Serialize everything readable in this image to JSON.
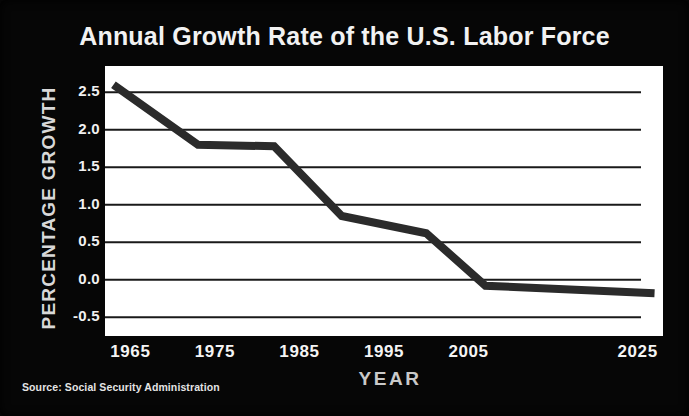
{
  "chart_data": {
    "type": "line",
    "title": "Annual Growth Rate of the U.S. Labor Force",
    "xlabel": "YEAR",
    "ylabel": "PERCENTAGE GROWTH",
    "source": "Source: Social Security Administration",
    "grid": true,
    "legend": false,
    "xlim": [
      1962,
      2028
    ],
    "ylim": [
      -0.75,
      2.85
    ],
    "xticks": [
      "1965",
      "1975",
      "1985",
      "1995",
      "2005",
      "2025"
    ],
    "xtick_values": [
      1965,
      1975,
      1985,
      1995,
      2005,
      2025
    ],
    "yticks": [
      "2.5",
      "2.0",
      "1.5",
      "1.0",
      "0.5",
      "0.0",
      "-0.5"
    ],
    "ytick_values": [
      2.5,
      2.0,
      1.5,
      1.0,
      0.5,
      0.0,
      -0.5
    ],
    "series": [
      {
        "name": "Annual growth rate of the U.S. labor force",
        "color": "#2b2b2b",
        "x": [
          1963,
          1973,
          1982,
          1990,
          2000,
          2007,
          2027
        ],
        "values": [
          2.6,
          1.8,
          1.78,
          0.85,
          0.62,
          -0.08,
          -0.18
        ]
      }
    ]
  },
  "colors": {
    "background": "#060606",
    "plot_background": "#ffffff",
    "line": "#2b2b2b",
    "grid": "#1a1a1a",
    "title_text": "#f2f2f2",
    "axis_text": "#f0f0f0"
  }
}
